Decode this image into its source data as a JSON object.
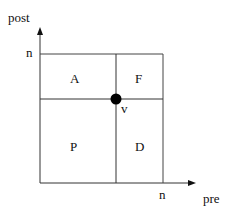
{
  "diagram": {
    "axes": {
      "y_label": "post",
      "x_label": "pre",
      "y_max_label": "n",
      "x_max_label": "n"
    },
    "regions": [
      {
        "id": "A",
        "label": "A"
      },
      {
        "id": "F",
        "label": "F"
      },
      {
        "id": "P",
        "label": "P"
      },
      {
        "id": "D",
        "label": "D"
      }
    ],
    "point": {
      "label": "v"
    },
    "colors": {
      "line": "#333333",
      "point": "#000000"
    }
  }
}
